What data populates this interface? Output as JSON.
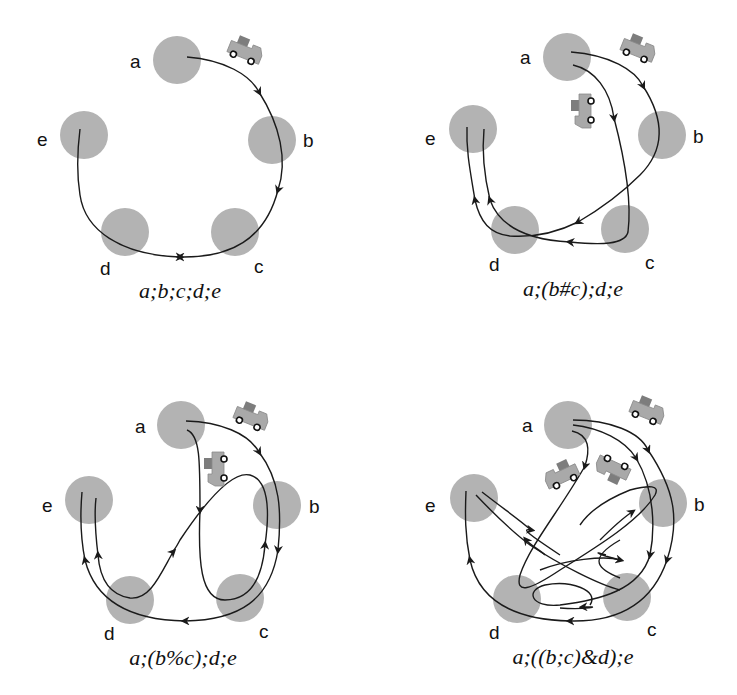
{
  "figure": {
    "colors": {
      "node": "#b3b3b3",
      "edge": "#1a1a1a",
      "truck": "#a9a9a9",
      "cargo": "#7d7d7d"
    },
    "node_labels": [
      "a",
      "b",
      "c",
      "d",
      "e"
    ],
    "panels": [
      {
        "id": "sequential",
        "caption": "a;b;c;d;e",
        "labels": {
          "a": "a",
          "b": "b",
          "c": "c",
          "d": "d",
          "e": "e"
        },
        "trucks": 1
      },
      {
        "id": "choice",
        "caption": "a;(b#c);d;e",
        "labels": {
          "a": "a",
          "b": "b",
          "c": "c",
          "d": "d",
          "e": "e"
        },
        "trucks": 2
      },
      {
        "id": "interleaving",
        "caption": "a;(b%c);d;e",
        "labels": {
          "a": "a",
          "b": "b",
          "c": "c",
          "d": "d",
          "e": "e"
        },
        "trucks": 2
      },
      {
        "id": "parallel",
        "caption": "a;((b;c)&d);e",
        "labels": {
          "a": "a",
          "b": "b",
          "c": "c",
          "d": "d",
          "e": "e"
        },
        "trucks": 3
      }
    ]
  }
}
